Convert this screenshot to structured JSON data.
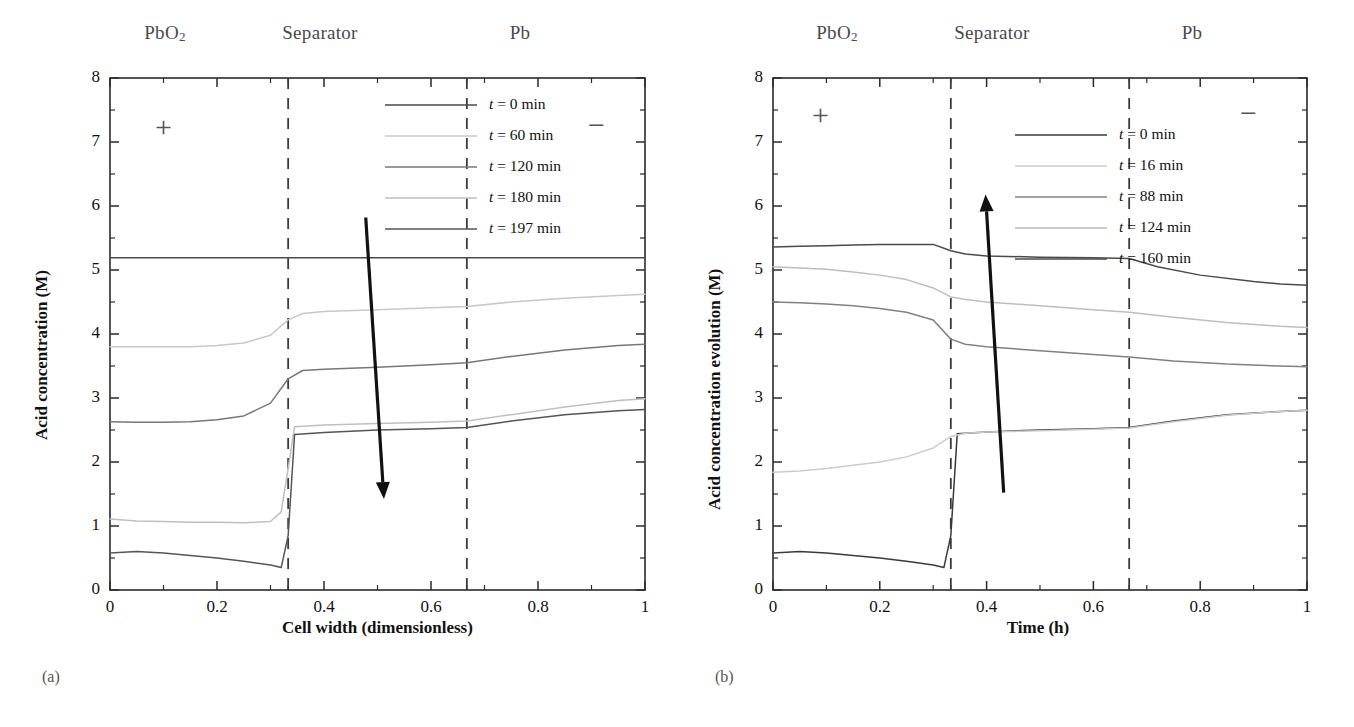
{
  "figure": {
    "panels": [
      {
        "id": "a",
        "subfig_label": "(a)",
        "regions": [
          "PbO2",
          "Separator",
          "Pb"
        ],
        "region_labels_html": [
          "PbO<sub>2</sub>",
          "Separator",
          "Pb"
        ],
        "polarity_left": "+",
        "polarity_right": "−"
      },
      {
        "id": "b",
        "subfig_label": "(b)",
        "regions": [
          "PbO2",
          "Separator",
          "Pb"
        ],
        "region_labels_html": [
          "PbO<sub>2</sub>",
          "Separator",
          "Pb"
        ],
        "polarity_left": "+",
        "polarity_right": "−"
      }
    ]
  },
  "chart_data": [
    {
      "type": "line",
      "panel": "a",
      "title": "",
      "xlabel": "Cell width (dimensionless)",
      "ylabel": "Acid concentration (M)",
      "xlim": [
        0,
        1
      ],
      "ylim": [
        0,
        8
      ],
      "xticks": [
        0,
        0.2,
        0.4,
        0.6,
        0.8,
        1
      ],
      "xticklabels": [
        "0",
        "0.2",
        "0.4",
        "0.6",
        "0.8",
        "1"
      ],
      "xminor_step": 0.1,
      "yticks": [
        0,
        1,
        2,
        3,
        4,
        5,
        6,
        7,
        8
      ],
      "yticklabels": [
        "0",
        "1",
        "2",
        "3",
        "4",
        "5",
        "6",
        "7",
        "8"
      ],
      "yminor_step": 0.5,
      "grid": false,
      "legend_position": "upper-center-right",
      "region_boundaries": [
        0.333,
        0.667
      ],
      "annotation_arrow": {
        "from": [
          0.478,
          5.82
        ],
        "to": [
          0.512,
          1.42
        ],
        "meaning": "decreasing acid concentration with time"
      },
      "series": [
        {
          "name": "t = 0 min",
          "color": "#4a4a4a",
          "x": [
            0,
            0.1,
            0.2,
            0.3,
            0.333,
            0.4,
            0.5,
            0.6,
            0.667,
            0.8,
            0.9,
            1
          ],
          "y": [
            5.19,
            5.19,
            5.19,
            5.19,
            5.19,
            5.19,
            5.19,
            5.19,
            5.19,
            5.19,
            5.19,
            5.19
          ]
        },
        {
          "name": "t = 60 min",
          "color": "#c8c8c8",
          "x": [
            0,
            0.05,
            0.1,
            0.15,
            0.2,
            0.25,
            0.3,
            0.333,
            0.36,
            0.4,
            0.5,
            0.6,
            0.667,
            0.75,
            0.85,
            0.95,
            1
          ],
          "y": [
            3.8,
            3.8,
            3.8,
            3.8,
            3.82,
            3.86,
            3.98,
            4.22,
            4.32,
            4.35,
            4.38,
            4.41,
            4.43,
            4.5,
            4.56,
            4.6,
            4.62
          ]
        },
        {
          "name": "t = 120 min",
          "color": "#777777",
          "x": [
            0,
            0.05,
            0.1,
            0.15,
            0.2,
            0.25,
            0.3,
            0.333,
            0.36,
            0.4,
            0.5,
            0.6,
            0.667,
            0.75,
            0.85,
            0.95,
            1
          ],
          "y": [
            2.63,
            2.62,
            2.62,
            2.63,
            2.66,
            2.72,
            2.92,
            3.3,
            3.43,
            3.45,
            3.48,
            3.52,
            3.55,
            3.65,
            3.75,
            3.82,
            3.84
          ]
        },
        {
          "name": "t = 180 min",
          "color": "#bfbfbf",
          "x": [
            0,
            0.05,
            0.1,
            0.15,
            0.2,
            0.25,
            0.3,
            0.32,
            0.333,
            0.345,
            0.4,
            0.5,
            0.6,
            0.667,
            0.75,
            0.85,
            0.95,
            1
          ],
          "y": [
            1.11,
            1.08,
            1.07,
            1.06,
            1.06,
            1.05,
            1.07,
            1.22,
            1.9,
            2.55,
            2.58,
            2.6,
            2.62,
            2.64,
            2.74,
            2.86,
            2.96,
            2.99
          ]
        },
        {
          "name": "t = 197 min",
          "color": "#555555",
          "x": [
            0,
            0.05,
            0.1,
            0.15,
            0.2,
            0.25,
            0.3,
            0.32,
            0.333,
            0.345,
            0.4,
            0.5,
            0.6,
            0.667,
            0.75,
            0.85,
            0.95,
            1
          ],
          "y": [
            0.58,
            0.6,
            0.58,
            0.54,
            0.5,
            0.45,
            0.39,
            0.35,
            0.85,
            2.43,
            2.46,
            2.5,
            2.52,
            2.54,
            2.64,
            2.74,
            2.8,
            2.82
          ]
        }
      ]
    },
    {
      "type": "line",
      "panel": "b",
      "title": "",
      "xlabel": "Time (h)",
      "ylabel": "Acid concentration evolution (M)",
      "xlim": [
        0,
        1
      ],
      "ylim": [
        0,
        8
      ],
      "xticks": [
        0,
        0.2,
        0.4,
        0.6,
        0.8,
        1
      ],
      "xticklabels": [
        "0",
        "0.2",
        "0.4",
        "0.6",
        "0.8",
        "1"
      ],
      "xminor_step": 0.1,
      "yticks": [
        0,
        1,
        2,
        3,
        4,
        5,
        6,
        7,
        8
      ],
      "yticklabels": [
        "0",
        "1",
        "2",
        "3",
        "4",
        "5",
        "6",
        "7",
        "8"
      ],
      "yminor_step": 0.5,
      "grid": false,
      "legend_position": "upper-center-right",
      "region_boundaries": [
        0.333,
        0.667
      ],
      "annotation_arrow": {
        "from": [
          0.432,
          1.52
        ],
        "to": [
          0.398,
          6.18
        ],
        "meaning": "increasing acid concentration with time"
      },
      "series": [
        {
          "name": "t = 0 min",
          "color": "#3a3a3a",
          "x": [
            0,
            0.05,
            0.1,
            0.15,
            0.2,
            0.25,
            0.3,
            0.32,
            0.333,
            0.345,
            0.4,
            0.5,
            0.6,
            0.667,
            0.75,
            0.85,
            0.95,
            1
          ],
          "y": [
            0.58,
            0.6,
            0.58,
            0.54,
            0.5,
            0.45,
            0.39,
            0.35,
            0.85,
            2.44,
            2.47,
            2.5,
            2.52,
            2.54,
            2.64,
            2.74,
            2.79,
            2.81
          ]
        },
        {
          "name": "t = 16 min",
          "color": "#cccccc",
          "x": [
            0,
            0.05,
            0.1,
            0.15,
            0.2,
            0.25,
            0.3,
            0.333,
            0.36,
            0.4,
            0.5,
            0.6,
            0.667,
            0.75,
            0.85,
            0.95,
            1
          ],
          "y": [
            1.84,
            1.86,
            1.9,
            1.95,
            2.0,
            2.08,
            2.22,
            2.4,
            2.45,
            2.47,
            2.49,
            2.51,
            2.53,
            2.63,
            2.73,
            2.79,
            2.81
          ]
        },
        {
          "name": "t = 88 min",
          "color": "#808080",
          "x": [
            0,
            0.05,
            0.1,
            0.15,
            0.2,
            0.25,
            0.3,
            0.333,
            0.36,
            0.4,
            0.5,
            0.6,
            0.667,
            0.75,
            0.85,
            0.95,
            1
          ],
          "y": [
            4.5,
            4.49,
            4.47,
            4.44,
            4.4,
            4.34,
            4.22,
            3.92,
            3.84,
            3.8,
            3.74,
            3.68,
            3.64,
            3.58,
            3.53,
            3.5,
            3.49
          ]
        },
        {
          "name": "t = 124 min",
          "color": "#bdbdbd",
          "x": [
            0,
            0.05,
            0.1,
            0.15,
            0.2,
            0.25,
            0.3,
            0.333,
            0.36,
            0.4,
            0.5,
            0.6,
            0.667,
            0.75,
            0.85,
            0.95,
            1
          ],
          "y": [
            5.05,
            5.03,
            5.01,
            4.97,
            4.92,
            4.85,
            4.72,
            4.58,
            4.54,
            4.5,
            4.44,
            4.38,
            4.34,
            4.26,
            4.18,
            4.12,
            4.1
          ]
        },
        {
          "name": "t = 160 min",
          "color": "#4a4a4a",
          "x": [
            0,
            0.05,
            0.1,
            0.15,
            0.2,
            0.25,
            0.3,
            0.333,
            0.36,
            0.4,
            0.5,
            0.6,
            0.667,
            0.72,
            0.8,
            0.9,
            0.95,
            1
          ],
          "y": [
            5.36,
            5.37,
            5.38,
            5.39,
            5.4,
            5.4,
            5.4,
            5.3,
            5.25,
            5.22,
            5.2,
            5.19,
            5.18,
            5.05,
            4.92,
            4.82,
            4.78,
            4.76
          ]
        }
      ]
    }
  ]
}
